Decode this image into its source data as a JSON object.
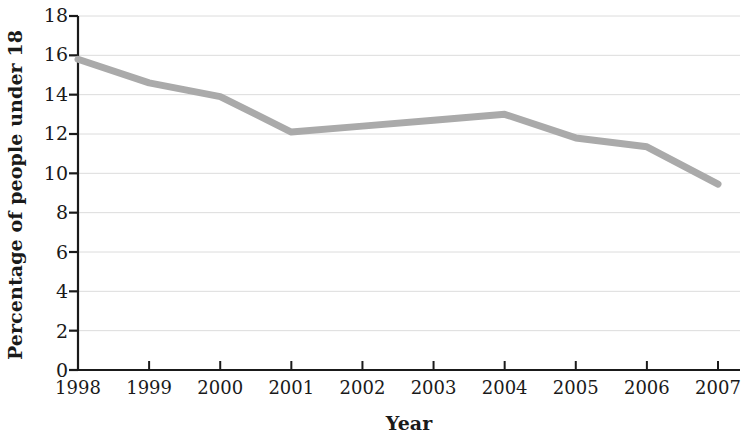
{
  "chart_data": {
    "type": "line",
    "title": "",
    "xlabel": "Year",
    "ylabel": "Percentage of people under 18",
    "categories": [
      "1998",
      "1999",
      "2000",
      "2001",
      "2002",
      "2003",
      "2004",
      "2005",
      "2006",
      "2007"
    ],
    "x": [
      1998,
      1999,
      2000,
      2001,
      2002,
      2003,
      2004,
      2005,
      2006,
      2007
    ],
    "values": [
      15.8,
      14.6,
      13.9,
      12.1,
      12.4,
      12.7,
      13.0,
      11.8,
      11.35,
      9.45
    ],
    "series": [
      {
        "name": "Percentage of people under 18",
        "values": [
          15.8,
          14.6,
          13.9,
          12.1,
          12.4,
          12.7,
          13.0,
          11.8,
          11.35,
          9.45
        ]
      }
    ],
    "ylim": [
      0,
      18
    ],
    "yticks": [
      0,
      2,
      4,
      6,
      8,
      10,
      12,
      14,
      16,
      18
    ],
    "ytick_labels": [
      "0",
      "2",
      "4",
      "6",
      "8",
      "10",
      "12",
      "14",
      "16",
      "18"
    ],
    "xlim": [
      1998,
      2007
    ],
    "grid": "horizontal",
    "legend": "none",
    "line_color": "#aaaaaa",
    "line_width": 7,
    "axis_color": "#1a1a1a",
    "grid_color": "#dcdcdc",
    "background_color": "#ffffff",
    "annotations": []
  }
}
